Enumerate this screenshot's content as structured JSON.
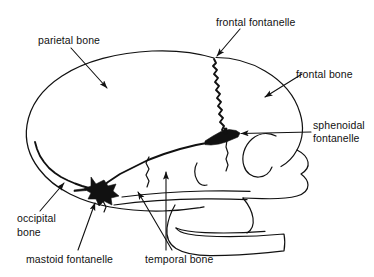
{
  "figure": {
    "background_color": "#ffffff",
    "line_color": "#111111",
    "fontanelle_color": "#111111"
  },
  "labels": {
    "frontal_fontanelle": "frontal fontanelle",
    "parietal_bone": "parietal bone",
    "frontal_bone": "frontal bone",
    "sphenoidal_fontanelle_line1": "sphenoidal",
    "sphenoidal_fontanelle_line2": "fontanelle",
    "occipital_bone_line1": "occipital",
    "occipital_bone_line2": "bone",
    "mastoid_fontanelle": "mastoid fontanelle",
    "temporal_bone": "temporal bone"
  },
  "structures": [
    {
      "name": "parietal bone",
      "kind": "bone"
    },
    {
      "name": "frontal bone",
      "kind": "bone"
    },
    {
      "name": "occipital bone",
      "kind": "bone"
    },
    {
      "name": "temporal bone",
      "kind": "bone"
    },
    {
      "name": "frontal fontanelle",
      "kind": "fontanelle"
    },
    {
      "name": "sphenoidal fontanelle",
      "kind": "fontanelle"
    },
    {
      "name": "mastoid fontanelle",
      "kind": "fontanelle"
    }
  ]
}
